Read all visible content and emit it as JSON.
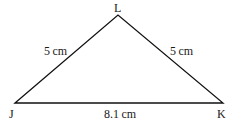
{
  "diagram": {
    "type": "triangle",
    "vertices": [
      {
        "name": "J",
        "x": 15,
        "y": 103
      },
      {
        "name": "L",
        "x": 118,
        "y": 15
      },
      {
        "name": "K",
        "x": 223,
        "y": 103
      }
    ],
    "vertex_labels": {
      "J": "J",
      "K": "K",
      "L": "L"
    },
    "sides": {
      "JL": "5 cm",
      "LK": "5 cm",
      "JK": "8.1 cm"
    }
  }
}
